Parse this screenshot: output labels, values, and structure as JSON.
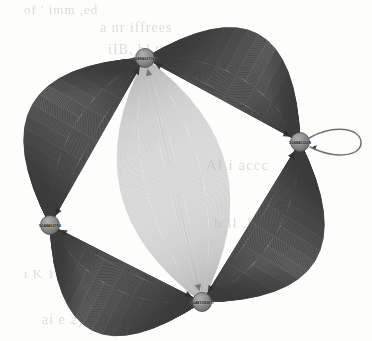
{
  "figure": {
    "type": "network-multigraph",
    "title": "",
    "canvas": {
      "width": 372,
      "height": 341,
      "background": "#fdfdfc"
    },
    "style": {
      "node_fill": "#8d8d8d",
      "node_stroke": "#4a4a4a",
      "edge_dark": "#3c3c3c",
      "edge_light": "#b9b9b9",
      "label_color": "#151515"
    }
  },
  "chart_data": {
    "type": "graph",
    "title": "",
    "xlabel": "",
    "ylabel": "",
    "layout": "circular",
    "directed": true,
    "nodes": [
      {
        "id": "n_top",
        "label": "50484027020",
        "x": 145,
        "y": 58,
        "r": 9.5,
        "degree": 3
      },
      {
        "id": "n_right",
        "label": "5048403008",
        "x": 300,
        "y": 142,
        "r": 9.5,
        "degree": 3
      },
      {
        "id": "n_bottom",
        "label": "5048158387I",
        "x": 202,
        "y": 302,
        "r": 9.5,
        "degree": 3
      },
      {
        "id": "n_left",
        "label": "5048402783",
        "x": 50,
        "y": 225,
        "r": 9.5,
        "degree": 3
      }
    ],
    "edge_bundles": [
      {
        "source": "n_top",
        "target": "n_right",
        "count": 140,
        "color": "#3c3c3c",
        "weight": "heavy",
        "bow": "outer"
      },
      {
        "source": "n_right",
        "target": "n_bottom",
        "count": 140,
        "color": "#3c3c3c",
        "weight": "heavy",
        "bow": "outer"
      },
      {
        "source": "n_bottom",
        "target": "n_left",
        "count": 140,
        "color": "#3c3c3c",
        "weight": "heavy",
        "bow": "outer"
      },
      {
        "source": "n_left",
        "target": "n_top",
        "count": 140,
        "color": "#3c3c3c",
        "weight": "heavy",
        "bow": "outer"
      },
      {
        "source": "n_top",
        "target": "n_bottom",
        "count": 120,
        "color": "#b9b9b9",
        "weight": "light",
        "bow": "lens"
      }
    ],
    "self_loops": [
      {
        "node": "n_right",
        "count": 1,
        "color": "#6e6e6e",
        "direction": "east"
      }
    ],
    "legend": [],
    "annotations": []
  },
  "background_text": {
    "description": "faint scanned book page text bleeding through",
    "lines": [
      {
        "text": "of ' imm ,ed",
        "x": 24,
        "y": 10,
        "size": 13
      },
      {
        "text": "a  nr iffrees",
        "x": 100,
        "y": 30,
        "size": 14
      },
      {
        "text": "iIB, bl  tmi i",
        "x": 108,
        "y": 52,
        "size": 14
      },
      {
        "text": "lh-   \\AR",
        "x": 188,
        "y": 74,
        "size": 15
      },
      {
        "text": "AI  i accc",
        "x": 206,
        "y": 168,
        "size": 15
      },
      {
        "text": "h   ll .I",
        "x": 214,
        "y": 226,
        "size": 15
      },
      {
        "text": "ı  K  1 1 L",
        "x": 24,
        "y": 276,
        "size": 13
      },
      {
        "text": "ai e 2) t, 1 pse",
        "x": 42,
        "y": 322,
        "size": 14
      }
    ]
  }
}
